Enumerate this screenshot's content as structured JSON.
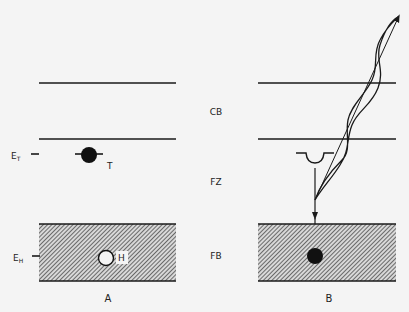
{
  "diagram": {
    "panels": [
      {
        "id": "A",
        "label": "A"
      },
      {
        "id": "B",
        "label": "B"
      }
    ],
    "regions": {
      "cb": "CB",
      "fz": "FZ",
      "fb": "FB"
    },
    "levels": {
      "et_main": "E",
      "et_sub": "T",
      "eh_main": "E",
      "eh_sub": "H"
    },
    "markers": {
      "trap_label": "T",
      "hole_label": "H"
    },
    "colors": {
      "background": "#f4f4f4",
      "line": "#1a1a1a",
      "hatch": "#333333"
    }
  }
}
